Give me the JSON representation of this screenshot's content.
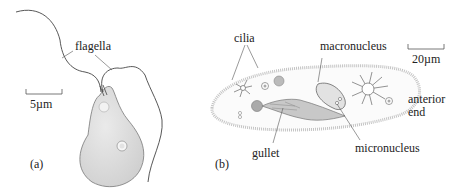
{
  "panel_a": {
    "label": "(a)",
    "flagella_label": "flagella",
    "scale_bar": "5µm"
  },
  "panel_b": {
    "label": "(b)",
    "labels": {
      "cilia": "cilia",
      "macronucleus": "macronucleus",
      "micronucleus": "micronucleus",
      "gullet": "gullet",
      "anterior_line1": "anterior",
      "anterior_line2": "end"
    },
    "scale_bar": "20µm"
  },
  "colors": {
    "cell_fill": "#d9d9d9",
    "outline": "#555555",
    "line": "#333333",
    "cilia": "#bdbdbd"
  }
}
